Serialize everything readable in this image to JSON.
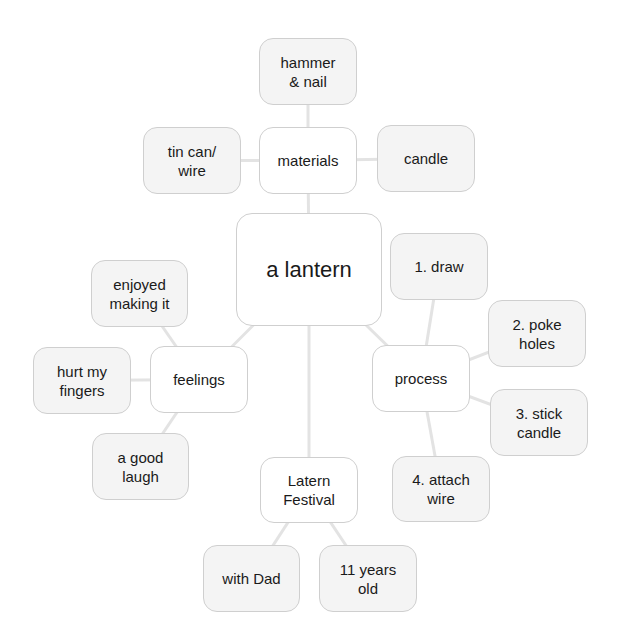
{
  "diagram": {
    "type": "concept-map",
    "root": {
      "id": "root",
      "label": "a lantern"
    },
    "nodes": [
      {
        "id": "materials",
        "label": "materials",
        "kind": "category",
        "parent": "root"
      },
      {
        "id": "hammer",
        "label": "hammer\n& nail",
        "kind": "leaf",
        "parent": "materials"
      },
      {
        "id": "tincan",
        "label": "tin can/\nwire",
        "kind": "leaf",
        "parent": "materials"
      },
      {
        "id": "candle",
        "label": "candle",
        "kind": "leaf",
        "parent": "materials"
      },
      {
        "id": "feelings",
        "label": "feelings",
        "kind": "category",
        "parent": "root"
      },
      {
        "id": "enjoyed",
        "label": "enjoyed\nmaking it",
        "kind": "leaf",
        "parent": "feelings"
      },
      {
        "id": "hurt",
        "label": "hurt my\nfingers",
        "kind": "leaf",
        "parent": "feelings"
      },
      {
        "id": "laugh",
        "label": "a good\nlaugh",
        "kind": "leaf",
        "parent": "feelings"
      },
      {
        "id": "process",
        "label": "process",
        "kind": "category",
        "parent": "root"
      },
      {
        "id": "draw",
        "label": "1. draw",
        "kind": "leaf",
        "parent": "process"
      },
      {
        "id": "poke",
        "label": "2. poke\nholes",
        "kind": "leaf",
        "parent": "process"
      },
      {
        "id": "stick",
        "label": "3. stick\ncandle",
        "kind": "leaf",
        "parent": "process"
      },
      {
        "id": "attach",
        "label": "4. attach\nwire",
        "kind": "leaf",
        "parent": "process"
      },
      {
        "id": "festival",
        "label": "Latern\nFestival",
        "kind": "category",
        "parent": "root"
      },
      {
        "id": "dad",
        "label": "with Dad",
        "kind": "leaf",
        "parent": "festival"
      },
      {
        "id": "age",
        "label": "11 years\nold",
        "kind": "leaf",
        "parent": "festival"
      }
    ]
  },
  "colors": {
    "leaf_fill": "#f4f4f4",
    "category_fill": "#ffffff",
    "border": "#cfcfcf",
    "connector": "#e3e3e3",
    "text": "#1a1a1a"
  }
}
